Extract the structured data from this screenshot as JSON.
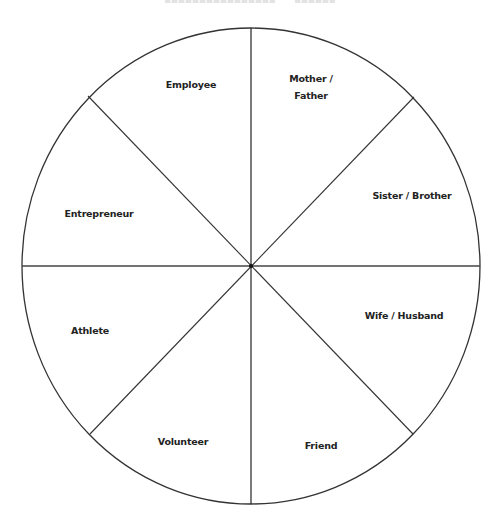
{
  "diagram": {
    "type": "role-wheel",
    "title_visible": false,
    "segments": [
      {
        "label": "Employee",
        "x": 191,
        "y": 84
      },
      {
        "label": "Mother /\nFather",
        "line1": "Mother /",
        "line2": "Father",
        "x": 311,
        "y": 87
      },
      {
        "label": "Sister / Brother",
        "x": 412,
        "y": 195
      },
      {
        "label": "Wife / Husband",
        "x": 404,
        "y": 315
      },
      {
        "label": "Friend",
        "x": 321,
        "y": 445
      },
      {
        "label": "Volunteer",
        "x": 183,
        "y": 441
      },
      {
        "label": "Athlete",
        "x": 90,
        "y": 330
      },
      {
        "label": "Entrepreneur",
        "x": 99,
        "y": 213
      }
    ],
    "geometry": {
      "center": [
        251,
        266
      ],
      "rx": 229,
      "ry": 238
    },
    "colors": {
      "stroke": "#333333",
      "text": "#222222",
      "background": "#ffffff"
    }
  }
}
